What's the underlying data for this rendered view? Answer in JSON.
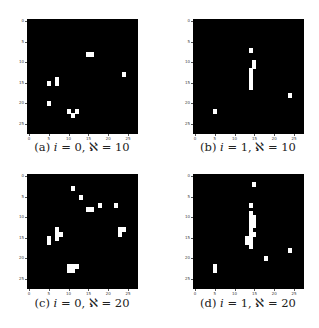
{
  "chart_data": [
    {
      "type": "heatmap",
      "title": "(a) i = 0, ℵ = 10",
      "label": "(a)",
      "i": 0,
      "aleph": 10,
      "grid_size": [
        28,
        28
      ],
      "xticks": [
        0,
        5,
        10,
        15,
        20,
        25
      ],
      "yticks": [
        0,
        5,
        10,
        15,
        20,
        25
      ],
      "colormap": "gray",
      "white_pixels": [
        [
          8,
          15
        ],
        [
          8,
          16
        ],
        [
          13,
          24
        ],
        [
          14,
          7
        ],
        [
          15,
          7
        ],
        [
          15,
          5
        ],
        [
          20,
          5
        ],
        [
          22,
          10
        ],
        [
          22,
          12
        ],
        [
          23,
          11
        ]
      ]
    },
    {
      "type": "heatmap",
      "title": "(b) i = 1, ℵ = 10",
      "label": "(b)",
      "i": 1,
      "aleph": 10,
      "grid_size": [
        28,
        28
      ],
      "xticks": [
        0,
        5,
        10,
        15,
        20,
        25
      ],
      "yticks": [
        0,
        5,
        10,
        15,
        20,
        25
      ],
      "colormap": "gray",
      "white_pixels": [
        [
          7,
          14
        ],
        [
          10,
          15
        ],
        [
          11,
          15
        ],
        [
          12,
          14
        ],
        [
          13,
          14
        ],
        [
          14,
          14
        ],
        [
          15,
          14
        ],
        [
          16,
          14
        ],
        [
          18,
          24
        ],
        [
          22,
          5
        ]
      ]
    },
    {
      "type": "heatmap",
      "title": "(c) i = 0, ℵ = 20",
      "label": "(c)",
      "i": 0,
      "aleph": 20,
      "grid_size": [
        28,
        28
      ],
      "xticks": [
        0,
        5,
        10,
        15,
        20,
        25
      ],
      "yticks": [
        0,
        5,
        10,
        15,
        20,
        25
      ],
      "colormap": "gray",
      "white_pixels": [
        [
          3,
          11
        ],
        [
          5,
          13
        ],
        [
          7,
          18
        ],
        [
          7,
          22
        ],
        [
          8,
          15
        ],
        [
          8,
          16
        ],
        [
          13,
          7
        ],
        [
          14,
          7
        ],
        [
          15,
          7
        ],
        [
          14,
          8
        ],
        [
          13,
          23
        ],
        [
          14,
          23
        ],
        [
          13,
          24
        ],
        [
          15,
          5
        ],
        [
          16,
          5
        ],
        [
          22,
          10
        ],
        [
          22,
          11
        ],
        [
          23,
          10
        ],
        [
          23,
          11
        ],
        [
          22,
          12
        ]
      ]
    },
    {
      "type": "heatmap",
      "title": "(d) i = 1, ℵ = 20",
      "label": "(d)",
      "i": 1,
      "aleph": 20,
      "grid_size": [
        28,
        28
      ],
      "xticks": [
        0,
        5,
        10,
        15,
        20,
        25
      ],
      "yticks": [
        0,
        5,
        10,
        15,
        20,
        25
      ],
      "colormap": "gray",
      "white_pixels": [
        [
          2,
          15
        ],
        [
          7,
          14
        ],
        [
          9,
          14
        ],
        [
          10,
          14
        ],
        [
          10,
          15
        ],
        [
          11,
          14
        ],
        [
          11,
          15
        ],
        [
          12,
          14
        ],
        [
          12,
          15
        ],
        [
          13,
          14
        ],
        [
          14,
          14
        ],
        [
          14,
          15
        ],
        [
          15,
          13
        ],
        [
          15,
          14
        ],
        [
          16,
          13
        ],
        [
          16,
          14
        ],
        [
          17,
          14
        ],
        [
          18,
          24
        ],
        [
          20,
          18
        ],
        [
          22,
          5
        ],
        [
          23,
          5
        ]
      ]
    }
  ],
  "panels": [
    {
      "label": "(a)",
      "var": "i",
      "i_value": "0",
      "aleph_value": "10"
    },
    {
      "label": "(b)",
      "var": "i",
      "i_value": "1",
      "aleph_value": "10"
    },
    {
      "label": "(c)",
      "var": "i",
      "i_value": "0",
      "aleph_value": "20"
    },
    {
      "label": "(d)",
      "var": "i",
      "i_value": "1",
      "aleph_value": "20"
    }
  ],
  "symbols": {
    "aleph": "ℵ",
    "eq": "=",
    "comma": ","
  },
  "ticks": [
    "0",
    "5",
    "10",
    "15",
    "20",
    "25"
  ],
  "colors": {
    "background": "#000000",
    "pixel": "#ffffff"
  }
}
